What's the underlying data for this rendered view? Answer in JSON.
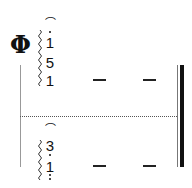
{
  "score": {
    "sign": "Φ",
    "upper_chord": {
      "fermata": "⌒",
      "notes": [
        "1",
        "5",
        "1"
      ],
      "top_note_high_dot": true
    },
    "lower_chord": {
      "fermata": "⌒",
      "notes": [
        "3",
        "1"
      ],
      "top_note_low_dot": true,
      "bottom_note_low_dots": 2
    },
    "sustain_dashes": [
      "—",
      "—"
    ],
    "ending": "final-barline"
  }
}
